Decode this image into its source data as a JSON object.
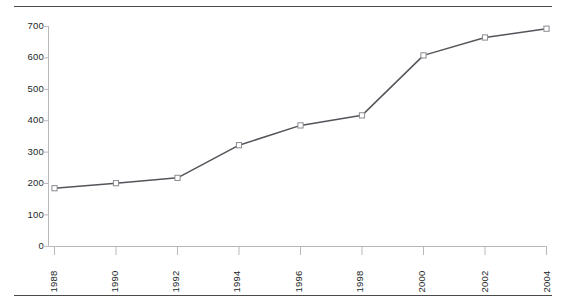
{
  "chart_data": {
    "type": "line",
    "title": "",
    "xlabel": "",
    "ylabel": "",
    "categories": [
      "1988",
      "1990",
      "1992",
      "1994",
      "1996",
      "1998",
      "2000",
      "2002",
      "2004"
    ],
    "x": [
      1988,
      1990,
      1992,
      1994,
      1996,
      1998,
      2000,
      2002,
      2004
    ],
    "values": [
      185,
      201,
      218,
      322,
      385,
      417,
      608,
      665,
      693
    ],
    "series": [
      {
        "name": "",
        "values": [
          185,
          201,
          218,
          322,
          385,
          417,
          608,
          665,
          693
        ]
      }
    ],
    "ylim": [
      0,
      700
    ],
    "yticks": [
      0,
      100,
      200,
      300,
      400,
      500,
      600,
      700
    ],
    "ytick_labels": [
      "0",
      "100",
      "200",
      "300",
      "400",
      "500",
      "600",
      "700"
    ],
    "xtick_labels": [
      "1988",
      "1990",
      "1992",
      "1994",
      "1996",
      "1998",
      "2000",
      "2002",
      "2004"
    ],
    "grid": false,
    "legend": "none",
    "marker": "square-open",
    "line_color": "#54545a",
    "marker_fill": "#ffffff",
    "marker_edge": "#8a8a90",
    "axis_color": "#b9b9bd",
    "rule_color": "#4a4a4a",
    "xlabel_rotation": -90
  }
}
